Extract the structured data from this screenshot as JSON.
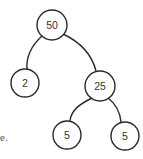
{
  "diagram": {
    "type": "binary-tree",
    "nodes": [
      {
        "id": "root",
        "label": "50",
        "cx": 52,
        "cy": 25,
        "r": 15
      },
      {
        "id": "left",
        "label": "2",
        "cx": 25,
        "cy": 83,
        "r": 14
      },
      {
        "id": "right",
        "label": "25",
        "cx": 100,
        "cy": 86,
        "r": 15
      },
      {
        "id": "right-left",
        "label": "5",
        "cx": 67,
        "cy": 135,
        "r": 14
      },
      {
        "id": "right-right",
        "label": "5",
        "cx": 125,
        "cy": 136,
        "r": 14
      }
    ],
    "edges": [
      {
        "from": "root",
        "to": "left"
      },
      {
        "from": "root",
        "to": "right"
      },
      {
        "from": "right",
        "to": "right-left"
      },
      {
        "from": "right",
        "to": "right-right"
      }
    ],
    "stroke_color": "#2a2a2a"
  },
  "fragment_text": "e."
}
